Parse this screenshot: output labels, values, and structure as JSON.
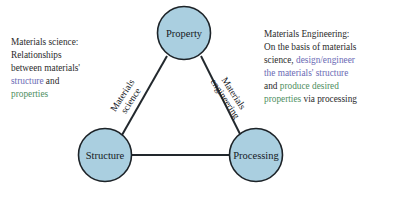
{
  "diagram": {
    "nodes": [
      {
        "id": "property",
        "label": "Property",
        "cx": 184,
        "cy": 33,
        "r": 26.5
      },
      {
        "id": "structure",
        "label": "Structure",
        "cx": 105,
        "cy": 155,
        "r": 26.5
      },
      {
        "id": "processing",
        "label": "Processing",
        "cx": 256,
        "cy": 155,
        "r": 26.5
      }
    ],
    "edges": [
      {
        "id": "structure-property",
        "label_line1": "Materials",
        "label_line2": "science",
        "rotation": -57
      },
      {
        "id": "property-processing",
        "label_line1": "Materials",
        "label_line2": "engineering",
        "rotation": 57
      },
      {
        "id": "structure-processing",
        "label_line1": "",
        "label_line2": "",
        "rotation": 0
      }
    ],
    "colors": {
      "node_fill": "#aacfe0",
      "node_stroke": "#1d2328",
      "edge_stroke": "#22282d",
      "background": "#ffffff",
      "text": "#2b2b2b",
      "highlight_structure": "#6a6ab4",
      "highlight_properties": "#4f8f5f"
    }
  },
  "left_text": {
    "line1": "Materials science:",
    "line2": "Relationships",
    "line3": "between materials'",
    "line4_highlight": "structure",
    "line4_plain": " and",
    "line5_highlight": "properties"
  },
  "right_text": {
    "line1": "Materials Engineering:",
    "line2": "On the basis of materials",
    "line3_plain": "science, ",
    "line3_highlight": "design/engineer",
    "line4_highlight": "the materials' structure",
    "line5_plain": "and ",
    "line5_highlight": "produce desired",
    "line6_highlight": "properties",
    "line6_plain": " via processing"
  }
}
